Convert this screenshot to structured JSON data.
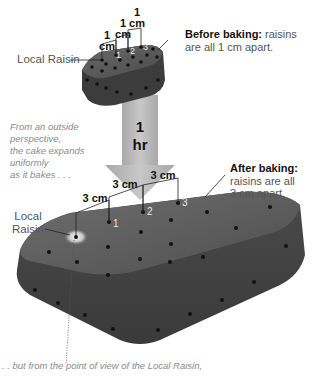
{
  "before": {
    "heading": "Before baking:",
    "text_line1": "raisins",
    "text_line2": "are all 1 cm apart.",
    "spacing_labels": [
      {
        "value": "1",
        "unit": "cm"
      },
      {
        "value": "1",
        "unit": "cm"
      },
      {
        "value": "1",
        "unit": "cm"
      }
    ],
    "raisin_numbers": [
      "1",
      "2",
      "3"
    ],
    "local_raisin_label": "Local Raisin"
  },
  "arrow": {
    "line1": "1",
    "line2": "hr"
  },
  "note_outside": {
    "line1": "From an outside perspective,",
    "line2": "the cake expands uniformly",
    "line3": "as it bakes . . ."
  },
  "after": {
    "heading": "After baking:",
    "text_line1": "raisins are all",
    "text_line2": "3 cm apart.",
    "spacing_labels": [
      "3 cm",
      "3 cm",
      "3 cm"
    ],
    "raisin_numbers": [
      "1",
      "2",
      "3"
    ],
    "local_raisin_label_line1": "Local",
    "local_raisin_label_line2": "Raisin"
  },
  "note_local": {
    "line1": ". . but from the point of view of the Local Raisin,"
  },
  "colors": {
    "cake_top": "#5a5a5a",
    "cake_side": "#3e3e3e",
    "arrow": "#b8b8b8",
    "raisin": "#111111",
    "note_text": "#8a8a8a"
  }
}
